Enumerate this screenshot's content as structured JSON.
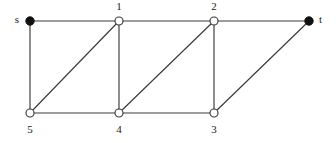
{
  "figure": {
    "type": "undirected-graph-diagram",
    "background_color": "#ffffff",
    "width": 336,
    "height": 143,
    "edge_color": "#3a3a3a",
    "terminal_node_color": "#111111",
    "internal_node_color": "#ffffff"
  },
  "nodes": [
    {
      "id": "s",
      "label": "s",
      "x": 30,
      "y": 21,
      "style": "filled",
      "radius": 4.2,
      "label_x": 19,
      "label_y": 20,
      "label_anchor": "anchor-end",
      "role": "source"
    },
    {
      "id": "1",
      "label": "1",
      "x": 119,
      "y": 21,
      "style": "hollow",
      "radius": 4.0,
      "label_x": 119,
      "label_y": 7,
      "label_anchor": "anchor-middle",
      "role": "internal"
    },
    {
      "id": "2",
      "label": "2",
      "x": 214,
      "y": 21,
      "style": "hollow",
      "radius": 4.0,
      "label_x": 214,
      "label_y": 7,
      "label_anchor": "anchor-middle",
      "role": "internal"
    },
    {
      "id": "t",
      "label": "t",
      "x": 309,
      "y": 21,
      "style": "filled",
      "radius": 4.2,
      "label_x": 319,
      "label_y": 20,
      "label_anchor": "anchor-start",
      "role": "sink"
    },
    {
      "id": "5",
      "label": "5",
      "x": 30,
      "y": 113,
      "style": "hollow",
      "radius": 4.0,
      "label_x": 30,
      "label_y": 130,
      "label_anchor": "anchor-middle",
      "role": "internal"
    },
    {
      "id": "4",
      "label": "4",
      "x": 119,
      "y": 113,
      "style": "hollow",
      "radius": 4.0,
      "label_x": 119,
      "label_y": 130,
      "label_anchor": "anchor-middle",
      "role": "internal"
    },
    {
      "id": "3",
      "label": "3",
      "x": 214,
      "y": 113,
      "style": "hollow",
      "radius": 4.0,
      "label_x": 214,
      "label_y": 130,
      "label_anchor": "anchor-middle",
      "role": "internal"
    }
  ],
  "edges": [
    {
      "from": "s",
      "to": "1",
      "x1": 30,
      "y1": 21,
      "x2": 119,
      "y2": 21,
      "kind": "top-horizontal"
    },
    {
      "from": "1",
      "to": "2",
      "x1": 119,
      "y1": 21,
      "x2": 214,
      "y2": 21,
      "kind": "top-horizontal"
    },
    {
      "from": "2",
      "to": "t",
      "x1": 214,
      "y1": 21,
      "x2": 309,
      "y2": 21,
      "kind": "top-horizontal"
    },
    {
      "from": "s",
      "to": "5",
      "x1": 30,
      "y1": 21,
      "x2": 30,
      "y2": 113,
      "kind": "vertical"
    },
    {
      "from": "1",
      "to": "4",
      "x1": 119,
      "y1": 21,
      "x2": 119,
      "y2": 113,
      "kind": "vertical"
    },
    {
      "from": "2",
      "to": "3",
      "x1": 214,
      "y1": 21,
      "x2": 214,
      "y2": 113,
      "kind": "vertical"
    },
    {
      "from": "5",
      "to": "4",
      "x1": 30,
      "y1": 113,
      "x2": 119,
      "y2": 113,
      "kind": "bottom-horizontal"
    },
    {
      "from": "4",
      "to": "3",
      "x1": 119,
      "y1": 113,
      "x2": 214,
      "y2": 113,
      "kind": "bottom-horizontal"
    },
    {
      "from": "5",
      "to": "1",
      "x1": 30,
      "y1": 113,
      "x2": 119,
      "y2": 21,
      "kind": "diagonal"
    },
    {
      "from": "4",
      "to": "2",
      "x1": 119,
      "y1": 113,
      "x2": 214,
      "y2": 21,
      "kind": "diagonal"
    },
    {
      "from": "3",
      "to": "t",
      "x1": 214,
      "y1": 113,
      "x2": 309,
      "y2": 21,
      "kind": "diagonal"
    }
  ]
}
